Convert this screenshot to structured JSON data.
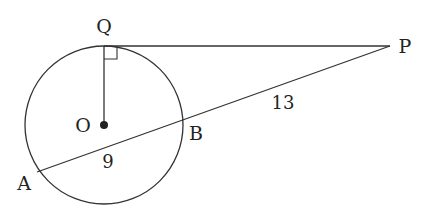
{
  "diagram": {
    "type": "geometry",
    "stroke_color": "#333333",
    "background": "#ffffff",
    "points": {
      "Q": {
        "label": "Q",
        "x": 104,
        "y": 46
      },
      "O": {
        "label": "O",
        "x": 104,
        "y": 125
      },
      "P": {
        "label": "P",
        "x": 390,
        "y": 46
      },
      "A": {
        "label": "A",
        "x": 37,
        "y": 172
      },
      "B": {
        "label": "B",
        "x": 182,
        "y": 120
      }
    },
    "circle": {
      "center": "O",
      "radius": 79
    },
    "segments": [
      {
        "from": "Q",
        "to": "P",
        "name": "tangent"
      },
      {
        "from": "Q",
        "to": "O",
        "name": "radius"
      },
      {
        "from": "A",
        "to": "P",
        "name": "secant"
      }
    ],
    "measures": {
      "AB": "9",
      "BP": "13"
    },
    "right_angle_at": "Q"
  }
}
